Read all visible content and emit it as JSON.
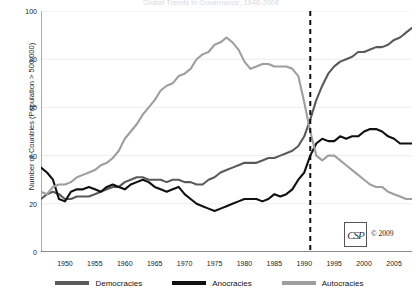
{
  "chart_data": {
    "type": "line",
    "title": "Global Trends in Governance, 1946-2008",
    "xlabel": "",
    "ylabel": "Number of Countries (Population > 500,000)",
    "xlim": [
      1946,
      2008
    ],
    "ylim": [
      0,
      100
    ],
    "yticks": [
      0,
      20,
      40,
      60,
      80,
      100
    ],
    "xticks": [
      1950,
      1955,
      1960,
      1965,
      1970,
      1975,
      1980,
      1985,
      1990,
      1995,
      2000,
      2005
    ],
    "grid": true,
    "minor_xticks_every": 1,
    "legend_position": "bottom",
    "annotations": [
      {
        "type": "vline",
        "x": 1991,
        "style": "dashed",
        "color": "#111111",
        "label": ""
      }
    ],
    "x": [
      1946,
      1947,
      1948,
      1949,
      1950,
      1951,
      1952,
      1953,
      1954,
      1955,
      1956,
      1957,
      1958,
      1959,
      1960,
      1961,
      1962,
      1963,
      1964,
      1965,
      1966,
      1967,
      1968,
      1969,
      1970,
      1971,
      1972,
      1973,
      1974,
      1975,
      1976,
      1977,
      1978,
      1979,
      1980,
      1981,
      1982,
      1983,
      1984,
      1985,
      1986,
      1987,
      1988,
      1989,
      1990,
      1991,
      1992,
      1993,
      1994,
      1995,
      1996,
      1997,
      1998,
      1999,
      2000,
      2001,
      2002,
      2003,
      2004,
      2005,
      2006,
      2007,
      2008
    ],
    "series": [
      {
        "name": "Democracies",
        "color": "#5a5a5a",
        "values": [
          22,
          24,
          25,
          24,
          22,
          22,
          23,
          23,
          23,
          24,
          25,
          26,
          27,
          27,
          29,
          30,
          31,
          31,
          30,
          30,
          30,
          29,
          30,
          30,
          29,
          29,
          28,
          28,
          30,
          31,
          33,
          34,
          35,
          36,
          37,
          37,
          37,
          38,
          39,
          39,
          40,
          41,
          42,
          44,
          48,
          55,
          63,
          69,
          74,
          77,
          79,
          80,
          81,
          83,
          83,
          84,
          85,
          85,
          86,
          88,
          89,
          91,
          93
        ]
      },
      {
        "name": "Anocracies",
        "color": "#101010",
        "values": [
          35,
          33,
          30,
          22,
          21,
          25,
          26,
          26,
          27,
          26,
          25,
          27,
          28,
          27,
          26,
          28,
          29,
          30,
          29,
          27,
          26,
          25,
          26,
          27,
          24,
          22,
          20,
          19,
          18,
          17,
          18,
          19,
          20,
          21,
          22,
          22,
          22,
          21,
          22,
          24,
          23,
          24,
          26,
          30,
          33,
          40,
          45,
          47,
          46,
          46,
          48,
          47,
          48,
          48,
          50,
          51,
          51,
          50,
          48,
          47,
          45,
          45,
          45
        ]
      },
      {
        "name": "Autocracies",
        "color": "#9e9e9e",
        "values": [
          25,
          24,
          27,
          28,
          28,
          29,
          31,
          32,
          33,
          34,
          36,
          37,
          39,
          42,
          47,
          50,
          53,
          57,
          60,
          63,
          67,
          69,
          70,
          73,
          74,
          76,
          80,
          82,
          83,
          86,
          87,
          89,
          87,
          84,
          79,
          76,
          77,
          78,
          78,
          77,
          77,
          77,
          76,
          73,
          62,
          50,
          40,
          38,
          40,
          40,
          38,
          36,
          34,
          32,
          30,
          28,
          27,
          27,
          25,
          24,
          23,
          22,
          22
        ]
      }
    ]
  },
  "logo": {
    "mark": "CSP",
    "copyright": "© 2009"
  },
  "legend": [
    {
      "label": "Democracies",
      "color": "#5a5a5a"
    },
    {
      "label": "Anocracies",
      "color": "#101010"
    },
    {
      "label": "Autocracies",
      "color": "#9e9e9e"
    }
  ]
}
